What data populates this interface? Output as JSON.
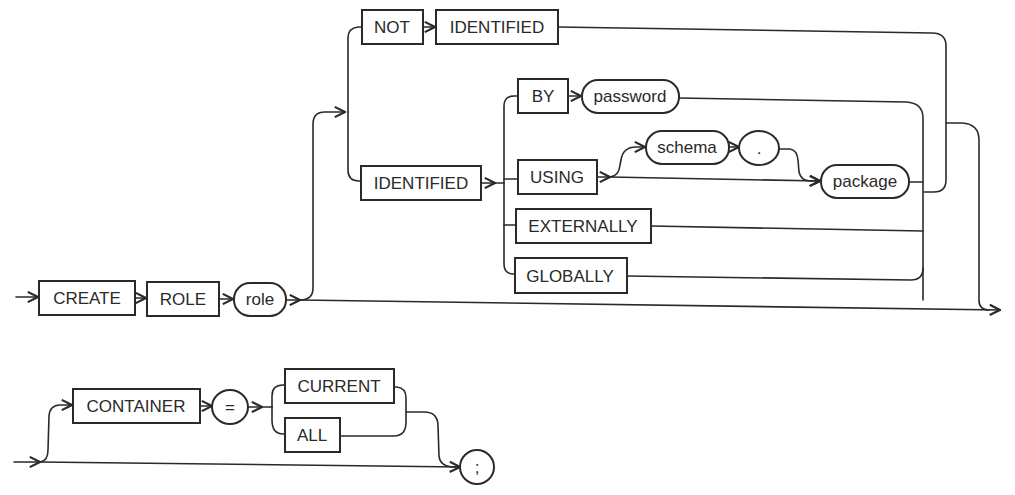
{
  "diagram": {
    "type": "railroad-syntax-diagram",
    "statement": "CREATE ROLE",
    "keywords": {
      "create": "CREATE",
      "role_kw": "ROLE",
      "not": "NOT",
      "identified_not": "IDENTIFIED",
      "identified": "IDENTIFIED",
      "by": "BY",
      "using": "USING",
      "externally": "EXTERNALLY",
      "globally": "GLOBALLY",
      "container": "CONTAINER",
      "current": "CURRENT",
      "all": "ALL"
    },
    "variables": {
      "role": "role",
      "password": "password",
      "schema": "schema",
      "package": "package"
    },
    "symbols": {
      "dot": ".",
      "equals": "=",
      "semicolon": ";"
    }
  }
}
